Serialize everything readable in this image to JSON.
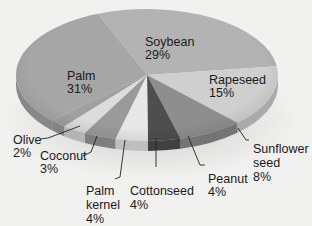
{
  "chart_data": {
    "type": "pie",
    "title": "",
    "style": "3d-tilted",
    "slices": [
      {
        "name": "Soybean",
        "value": 29,
        "label": "Soybean\n29%",
        "color": "#b3b3b3"
      },
      {
        "name": "Rapeseed",
        "value": 15,
        "label": "Rapeseed\n15%",
        "color": "#cfcfcf"
      },
      {
        "name": "Sunflower seed",
        "value": 8,
        "label": "Sunflower\nseed\n8%",
        "color": "#8e8e8e"
      },
      {
        "name": "Peanut",
        "value": 4,
        "label": "Peanut\n4%",
        "color": "#4e4e4e"
      },
      {
        "name": "Cottonseed",
        "value": 4,
        "label": "Cottonseed\n4%",
        "color": "#e8e8e8"
      },
      {
        "name": "Palm kernel",
        "value": 4,
        "label": "Palm\nkernel\n4%",
        "color": "#9a9a9a"
      },
      {
        "name": "Coconut",
        "value": 3,
        "label": "Coconut\n3%",
        "color": "#dcdcdc"
      },
      {
        "name": "Olive",
        "value": 2,
        "label": "Olive\n2%",
        "color": "#a0a0a0"
      },
      {
        "name": "Palm",
        "value": 31,
        "label": "Palm\n31%",
        "color": "#a6a6a6"
      }
    ],
    "legend": "none (callout labels)"
  },
  "labels": {
    "soybean": "Soybean\n29%",
    "rapeseed": "Rapeseed\n15%",
    "sunflower": "Sunflower\nseed\n8%",
    "peanut": "Peanut\n4%",
    "cottonseed": "Cottonseed\n4%",
    "palm_kernel": "Palm\nkernel\n4%",
    "coconut": "Coconut\n3%",
    "olive": "Olive\n2%",
    "palm": "Palm\n31%"
  }
}
